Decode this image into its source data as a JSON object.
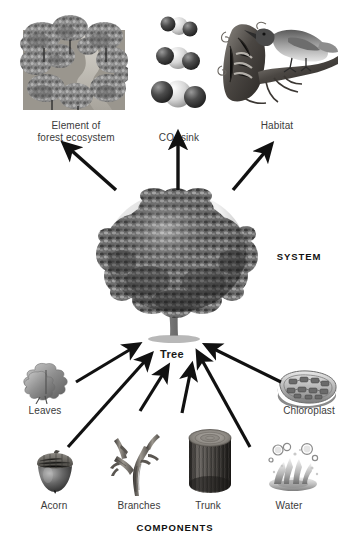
{
  "diagram": {
    "system_label": "SYSTEM",
    "components_label": "COMPONENTS",
    "center": {
      "label": "Tree",
      "icon": "broadleaf-tree-illustration"
    },
    "outputs": [
      {
        "id": "forest-ecosystem",
        "label": "Element of\nforest ecosystem",
        "icon": "forest-canopy-aerial-illustration"
      },
      {
        "id": "co2-sink",
        "label": "CO2 sink",
        "label_html": "CO<sub>2</sub> sink",
        "icon": "carbon-dioxide-molecule-illustration"
      },
      {
        "id": "habitat",
        "label": "Habitat",
        "icon": "bird-on-branch-illustration"
      }
    ],
    "components": [
      {
        "id": "leaves",
        "label": "Leaves",
        "icon": "oak-leaves-illustration"
      },
      {
        "id": "acorn",
        "label": "Acorn",
        "icon": "acorn-illustration"
      },
      {
        "id": "branches",
        "label": "Branches",
        "icon": "bare-branches-illustration"
      },
      {
        "id": "trunk",
        "label": "Trunk",
        "icon": "log-trunk-section-illustration"
      },
      {
        "id": "water",
        "label": "Water",
        "icon": "water-splash-illustration"
      },
      {
        "id": "chloroplast",
        "label": "Chloroplast",
        "icon": "chloroplast-illustration"
      }
    ],
    "arrows": {
      "outputs_direction": "tree-to-output (upward)",
      "components_direction": "component-to-tree (inward)",
      "color": "#111111",
      "count_up": 3,
      "count_in": 6
    },
    "colors": {
      "background": "#ffffff",
      "ink": "#231f20",
      "label_gray": "#3b3b3b",
      "arrow": "#111111"
    }
  }
}
